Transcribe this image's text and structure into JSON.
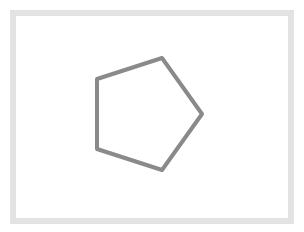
{
  "diagram": {
    "shape": "pentagon",
    "frame": {
      "border_color": "#e3e3e3",
      "background": "#ffffff"
    },
    "pentagon": {
      "stroke_color": "#8a8a8a",
      "stroke_width": 4,
      "fill": "none",
      "points": "162,58 202,114 162,170 97,149 97,79"
    }
  }
}
